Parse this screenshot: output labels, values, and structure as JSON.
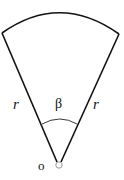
{
  "diagram": {
    "type": "circular-sector",
    "labels": {
      "left_radius": "r",
      "right_radius": "r",
      "angle": "β",
      "vertex": "o"
    },
    "colors": {
      "stroke": "#111111",
      "background": "#ffffff",
      "vertex_marker": "#9a9a9a"
    }
  }
}
